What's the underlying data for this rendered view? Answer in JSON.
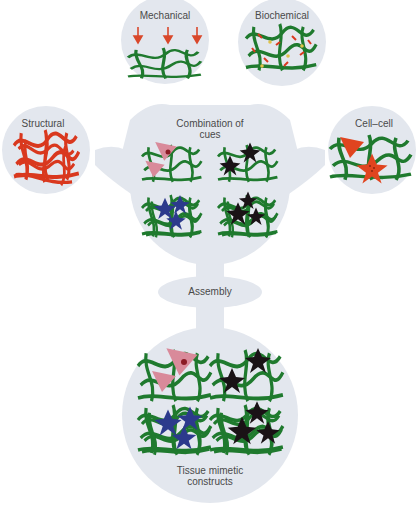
{
  "colors": {
    "bubble": "#e3e7ee",
    "fiber_green": "#1f7a2e",
    "fiber_red": "#d9381e",
    "node_yellow": "#e0c24a",
    "cell_pink": "#d98a9a",
    "cell_black": "#1a1216",
    "cell_blue": "#2c3a8c",
    "cell_red": "#e0441f",
    "arrow_red": "#d9482b",
    "text": "#4a4a4a"
  },
  "cues": {
    "mechanical": {
      "label": "Mechanical"
    },
    "biochemical": {
      "label": "Biochemical"
    },
    "structural": {
      "label": "Structural"
    },
    "cell_cell": {
      "label": "Cell–cell"
    }
  },
  "combination": {
    "line1": "Combination of",
    "line2": "cues"
  },
  "assembly": {
    "label": "Assembly"
  },
  "result": {
    "line1": "Tissue mimetic",
    "line2": "constructs"
  }
}
